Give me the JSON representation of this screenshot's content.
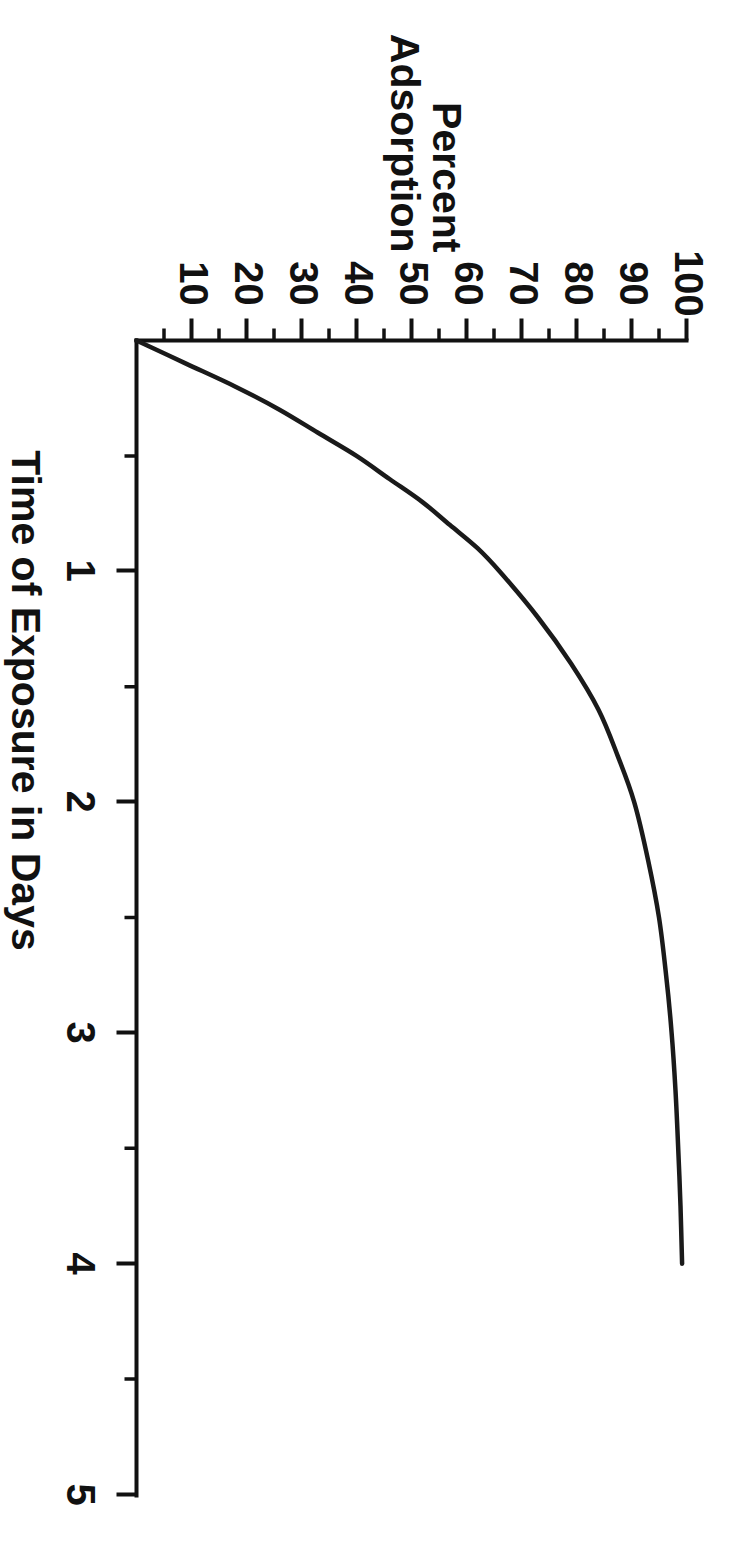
{
  "figure": {
    "background": "#ffffff",
    "ink_color": "#111111",
    "orientation": "rotated-90-clockwise"
  },
  "chart_data": {
    "type": "line",
    "title": "",
    "xlabel": "Time of Exposure in Days",
    "ylabel_line1": "Percent",
    "ylabel_line2": "Adsorption",
    "xlim": [
      0,
      5.2
    ],
    "ylim": [
      0,
      104
    ],
    "grid": false,
    "legend": null,
    "x_ticks": [
      1,
      2,
      3,
      4,
      5
    ],
    "x_tick_labels": [
      "1",
      "2",
      "3",
      "4",
      "5"
    ],
    "x_minor_ticks": [
      0.5,
      1.5,
      2.5,
      3.5,
      4.5
    ],
    "y_ticks": [
      10,
      20,
      30,
      40,
      50,
      60,
      70,
      80,
      90,
      100
    ],
    "y_tick_labels": [
      "10",
      "20",
      "30",
      "40",
      "50",
      "60",
      "70",
      "80",
      "90",
      "100"
    ],
    "y_minor_ticks": [
      5,
      15,
      25,
      35,
      45,
      55,
      65,
      75,
      85,
      95
    ],
    "series": [
      {
        "name": "Percent Adsorption vs Time",
        "x": [
          0.0,
          0.1,
          0.2,
          0.3,
          0.4,
          0.5,
          0.6,
          0.7,
          0.8,
          0.9,
          1.0,
          1.2,
          1.4,
          1.6,
          1.8,
          2.0,
          2.25,
          2.5,
          2.75,
          3.0,
          3.25,
          3.5,
          3.75,
          4.0
        ],
        "y": [
          0,
          9,
          18,
          26,
          33,
          40,
          46,
          52,
          57,
          62,
          66,
          73,
          79,
          84,
          87.5,
          90.5,
          93,
          95,
          96.3,
          97.3,
          98.0,
          98.5,
          98.9,
          99.2
        ]
      }
    ]
  },
  "axis_titles": {
    "x": "Time of Exposure in Days",
    "y_line1": "Percent",
    "y_line2": "Adsorption"
  }
}
